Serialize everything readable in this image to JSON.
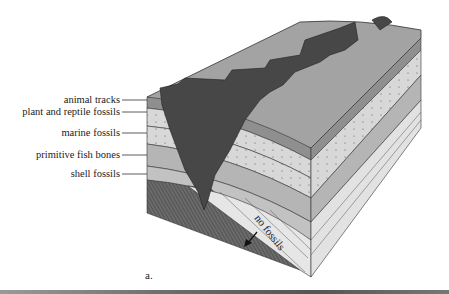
{
  "figure": {
    "caption": "a.",
    "labels": [
      {
        "id": "animal-tracks",
        "text": "animal tracks"
      },
      {
        "id": "plant-reptile-fossils",
        "text": "plant and reptile fossils"
      },
      {
        "id": "marine-fossils",
        "text": "marine fossils"
      },
      {
        "id": "primitive-fish-bones",
        "text": "primitive fish bones"
      },
      {
        "id": "shell-fossils",
        "text": "shell fossils"
      }
    ],
    "annotation": "no fossils",
    "colors": {
      "top_surface": "#9e9e9e",
      "canyon": "#474747",
      "light_layer": "#d6d6d6",
      "mid_layer": "#b3b3b3",
      "dark_hatched": "#5e5e5e",
      "tilted_layers": "#e4e4e4",
      "line": "#333333"
    }
  }
}
